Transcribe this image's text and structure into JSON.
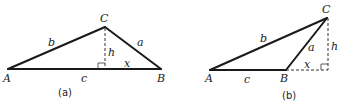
{
  "figure_a": {
    "caption": "(a)",
    "vertices": {
      "A": "A",
      "B": "B",
      "C": "C"
    },
    "sides": {
      "a": "a",
      "b": "b",
      "c": "c"
    },
    "height": "h",
    "segment": "x"
  },
  "figure_b": {
    "caption": "(b)",
    "vertices": {
      "A": "A",
      "B": "B",
      "C": "C"
    },
    "sides": {
      "a": "a",
      "b": "b",
      "c": "c"
    },
    "height": "h",
    "segment": "x"
  }
}
